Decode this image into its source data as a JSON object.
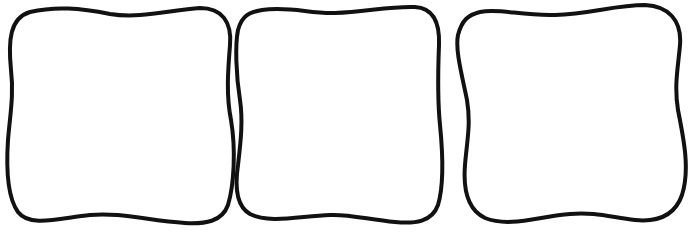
{
  "figure": {
    "background": "#ffffff",
    "stroke_color": "#111111",
    "stroke_width": 4,
    "shapes": [
      {
        "name": "wavy-square-1"
      },
      {
        "name": "wavy-square-2"
      },
      {
        "name": "wavy-square-3"
      }
    ],
    "caption": ""
  }
}
